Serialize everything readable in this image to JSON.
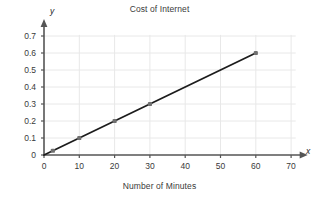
{
  "chart_data": {
    "type": "scatter",
    "title": "Cost of Internet",
    "xlabel": "Number of Minutes",
    "ylabel": "",
    "x_axis_letter": "x",
    "y_axis_letter": "y",
    "xlim": [
      0,
      73
    ],
    "ylim": [
      0,
      0.73
    ],
    "xticks": [
      0,
      10,
      20,
      30,
      40,
      50,
      60,
      70
    ],
    "xtick_labels": [
      "0",
      "10",
      "20",
      "30",
      "40",
      "50",
      "60",
      "70"
    ],
    "yticks": [
      0,
      0.1,
      0.2,
      0.3,
      0.4,
      0.5,
      0.6,
      0.7
    ],
    "ytick_labels": [
      "0",
      "0.1",
      "0.2",
      "0.3",
      "0.4",
      "0.5",
      "0.6",
      "0.7"
    ],
    "grid": true,
    "grid_color": "#e8e8e8",
    "legend": null,
    "series": [
      {
        "name": "Cost vs Minutes",
        "line": true,
        "markers": true,
        "marker_color": "#707070",
        "line_color": "#1c1c1c",
        "x": [
          2.5,
          10,
          20,
          30,
          60
        ],
        "y": [
          0.025,
          0.1,
          0.2,
          0.3,
          0.6
        ],
        "points": [
          {
            "x": 2.5,
            "y": 0.025
          },
          {
            "x": 10,
            "y": 0.1
          },
          {
            "x": 20,
            "y": 0.2
          },
          {
            "x": 30,
            "y": 0.3
          },
          {
            "x": 60,
            "y": 0.6
          }
        ],
        "relationship": "y = 0.01x"
      }
    ],
    "line_segment": {
      "x0": 0,
      "y0": 0,
      "x1": 60,
      "y1": 0.6
    },
    "axis_color": "#555555",
    "text_color": "#3a3a3a"
  }
}
